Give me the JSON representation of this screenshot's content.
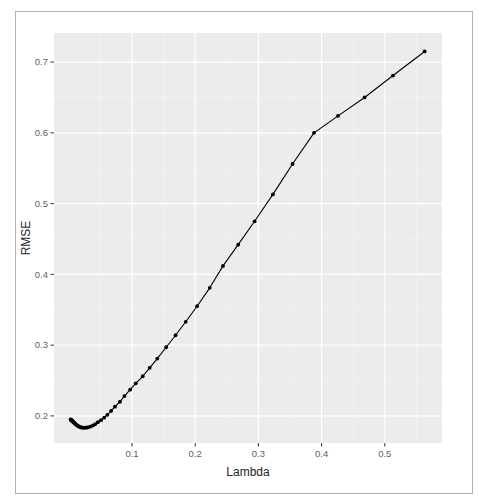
{
  "window": {
    "background": "#ffffff",
    "frame_border_color": "#b3b3b3"
  },
  "chart_data": {
    "type": "line",
    "title": "",
    "series_name": "RMSE vs Lambda",
    "xlabel": "Lambda",
    "ylabel": "RMSE",
    "x": [
      0.563,
      0.513,
      0.468,
      0.426,
      0.388,
      0.354,
      0.323,
      0.294,
      0.268,
      0.244,
      0.223,
      0.203,
      0.185,
      0.169,
      0.154,
      0.14,
      0.128,
      0.117,
      0.106,
      0.097,
      0.088,
      0.081,
      0.073,
      0.067,
      0.061,
      0.056,
      0.051,
      0.046,
      0.042,
      0.0385,
      0.0351,
      0.032,
      0.0291,
      0.0266,
      0.0242,
      0.0221,
      0.0201,
      0.0183,
      0.0167,
      0.0152,
      0.0139,
      0.0127,
      0.0115,
      0.0105,
      0.0096,
      0.0087,
      0.008,
      0.0073,
      0.0066,
      0.006,
      0.0055,
      0.005,
      0.0046,
      0.0042,
      0.0038,
      0.0035,
      0.0032,
      0.0029
    ],
    "y": [
      0.715,
      0.681,
      0.65,
      0.624,
      0.6,
      0.556,
      0.513,
      0.475,
      0.442,
      0.412,
      0.381,
      0.355,
      0.333,
      0.314,
      0.297,
      0.281,
      0.268,
      0.256,
      0.246,
      0.237,
      0.228,
      0.22,
      0.213,
      0.207,
      0.2015,
      0.1975,
      0.194,
      0.191,
      0.1885,
      0.1865,
      0.1852,
      0.1842,
      0.1836,
      0.1833,
      0.1832,
      0.1833,
      0.1836,
      0.1841,
      0.1847,
      0.1854,
      0.1862,
      0.187,
      0.1878,
      0.1886,
      0.1893,
      0.19,
      0.1907,
      0.1913,
      0.1918,
      0.1923,
      0.1928,
      0.1932,
      0.1936,
      0.1939,
      0.1942,
      0.1945,
      0.1947,
      0.1949
    ],
    "x_ticks": [
      0.1,
      0.2,
      0.3,
      0.4,
      0.5
    ],
    "x_tick_labels": [
      "0.1",
      "0.2",
      "0.3",
      "0.4",
      "0.5"
    ],
    "y_ticks": [
      0.2,
      0.3,
      0.4,
      0.5,
      0.6,
      0.7
    ],
    "y_tick_labels": [
      "0.2",
      "0.3",
      "0.4",
      "0.5",
      "0.6",
      "0.7"
    ],
    "x_minor_ticks": [
      0.05,
      0.15,
      0.25,
      0.35,
      0.45,
      0.55
    ],
    "y_minor_ticks": [
      0.25,
      0.35,
      0.45,
      0.55,
      0.65
    ],
    "xlim": [
      -0.0234,
      0.5905
    ],
    "ylim": [
      0.1617,
      0.7411
    ],
    "grid": "major+minor",
    "legend": "none",
    "style": {
      "panel_bg": "#ECECEC",
      "grid_major_color": "#FFFFFF",
      "grid_minor_color": "#FFFFFF",
      "line_color": "#000000",
      "point_color": "#000000",
      "point_radius": 1.9,
      "tick_color": "#333333",
      "tick_label_color": "#606060",
      "axis_title_color": "#1f1f1f"
    }
  }
}
